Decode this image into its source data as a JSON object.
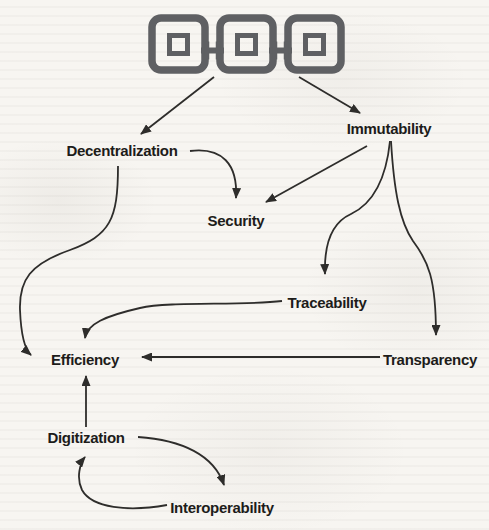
{
  "figure": {
    "colors": {
      "background": "#f7f5f1",
      "label_text": "#1d1c1a",
      "arrow": "#2e2d2b",
      "icon": "#5f6063"
    }
  },
  "icon": {
    "name": "blockchain-icon",
    "blocks": 3
  },
  "nodes": {
    "decentralization": {
      "label": "Decentralization"
    },
    "immutability": {
      "label": "Immutability"
    },
    "security": {
      "label": "Security"
    },
    "traceability": {
      "label": "Traceability"
    },
    "transparency": {
      "label": "Transparency"
    },
    "efficiency": {
      "label": "Efficiency"
    },
    "digitization": {
      "label": "Digitization"
    },
    "interoperability": {
      "label": "Interoperability"
    }
  },
  "edges": [
    {
      "from": "blockchain-icon",
      "to": "decentralization"
    },
    {
      "from": "blockchain-icon",
      "to": "immutability"
    },
    {
      "from": "decentralization",
      "to": "security"
    },
    {
      "from": "immutability",
      "to": "security"
    },
    {
      "from": "decentralization",
      "to": "efficiency"
    },
    {
      "from": "immutability",
      "to": "traceability"
    },
    {
      "from": "immutability",
      "to": "transparency"
    },
    {
      "from": "traceability",
      "to": "efficiency"
    },
    {
      "from": "transparency",
      "to": "efficiency"
    },
    {
      "from": "digitization",
      "to": "efficiency"
    },
    {
      "from": "digitization",
      "to": "interoperability"
    },
    {
      "from": "interoperability",
      "to": "digitization"
    }
  ]
}
